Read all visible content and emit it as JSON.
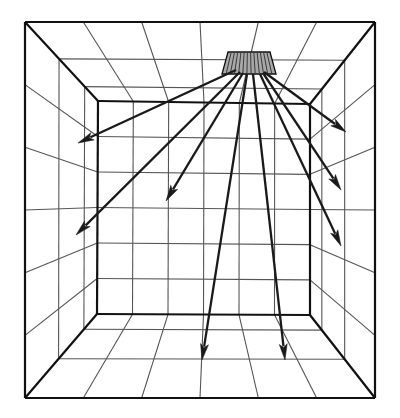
{
  "figure": {
    "title": "Room interior perspective with ceiling luminaire light distribution",
    "type": "line-diagram",
    "background_color": "#ffffff",
    "stroke_color": "#1a1a1a",
    "grid_color": "#555555",
    "frame_color": "#111111",
    "luminaire_fill": "#a8a8a8",
    "width": 400,
    "height": 418
  },
  "diagram_data": {
    "type": "perspective-room",
    "description": "One-point perspective box (room) drawn as wireframe grid, with a shaded rectangular ceiling luminaire emitting arrow rays toward the walls and floor.",
    "outer_frame": {
      "name": "near-opening-rectangle",
      "top_left": [
        25,
        22
      ],
      "top_right": [
        375,
        22
      ],
      "bottom_right": [
        375,
        398
      ],
      "bottom_left": [
        25,
        398
      ]
    },
    "inner_frame": {
      "name": "back-wall-rectangle",
      "top_left": [
        98,
        101
      ],
      "top_right": [
        310,
        104
      ],
      "bottom_right": [
        310,
        315
      ],
      "bottom_left": [
        97,
        314
      ]
    },
    "back_wall_grid": {
      "columns": 6,
      "rows": 6
    },
    "ceiling_grid": {
      "columns": 6,
      "depth_rows": 3
    },
    "floor_grid": {
      "columns": 6,
      "depth_rows": 3
    },
    "side_wall_grid": {
      "rows": 6,
      "depth_columns": 3
    },
    "luminaire": {
      "name": "ceiling-light-panel",
      "shape": "rectangle",
      "top_left": [
        228,
        52
      ],
      "top_right": [
        270,
        52
      ],
      "bottom_right": [
        276,
        74
      ],
      "bottom_left": [
        222,
        74
      ],
      "fill": "#a8a8a8",
      "hatch_lines": 13
    },
    "light_rays": [
      {
        "id": "ray-1",
        "label": "upper-left-wall",
        "from": [
          236,
          70
        ],
        "to": [
          78,
          143
        ],
        "target": "left-wall-upper"
      },
      {
        "id": "ray-2",
        "label": "far-left-wall",
        "from": [
          240,
          72
        ],
        "to": [
          76,
          235
        ],
        "target": "left-wall-lower"
      },
      {
        "id": "ray-3",
        "label": "back-wall-left",
        "from": [
          243,
          73
        ],
        "to": [
          166,
          201
        ],
        "target": "back-wall-left"
      },
      {
        "id": "ray-4",
        "label": "floor-left",
        "from": [
          247,
          74
        ],
        "to": [
          202,
          360
        ],
        "target": "floor-left"
      },
      {
        "id": "ray-5",
        "label": "floor-right",
        "from": [
          253,
          74
        ],
        "to": [
          285,
          360
        ],
        "target": "floor-right"
      },
      {
        "id": "ray-6",
        "label": "right-wall-upper",
        "from": [
          264,
          72
        ],
        "to": [
          346,
          132
        ],
        "target": "right-wall-upper"
      },
      {
        "id": "ray-7",
        "label": "right-wall-mid",
        "from": [
          263,
          73
        ],
        "to": [
          341,
          190
        ],
        "target": "right-wall-middle"
      },
      {
        "id": "ray-8",
        "label": "right-wall-lower",
        "from": [
          260,
          74
        ],
        "to": [
          341,
          246
        ],
        "target": "right-wall-lower"
      }
    ],
    "ray_count": 8,
    "arrowhead": {
      "style": "solid-triangle",
      "length": 16,
      "half_width": 4
    }
  }
}
